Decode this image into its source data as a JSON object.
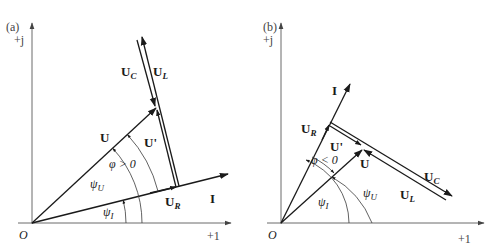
{
  "panels": [
    {
      "id": "a",
      "panel_label": "(a)",
      "axis_imag": "+j",
      "axis_real": "+1",
      "origin": "O",
      "vectors": {
        "I": "I",
        "U": "U",
        "U_prime": "U'",
        "U_R": "U",
        "U_R_sub": "R",
        "U_C": "U",
        "U_C_sub": "C",
        "U_L": "U",
        "U_L_sub": "L"
      },
      "angles": {
        "phi": "φ > 0",
        "psi_U": "ψ",
        "psi_U_sub": "U",
        "psi_I": "ψ",
        "psi_I_sub": "I"
      }
    },
    {
      "id": "b",
      "panel_label": "(b)",
      "axis_imag": "+j",
      "axis_real": "+1",
      "origin": "O",
      "vectors": {
        "I": "I",
        "U": "U",
        "U_prime": "U'",
        "U_R": "U",
        "U_R_sub": "R",
        "U_C": "U",
        "U_C_sub": "C",
        "U_L": "U",
        "U_L_sub": "L"
      },
      "angles": {
        "phi": "φ < 0",
        "psi_U": "ψ",
        "psi_U_sub": "U",
        "psi_I": "ψ",
        "psi_I_sub": "I"
      }
    }
  ]
}
